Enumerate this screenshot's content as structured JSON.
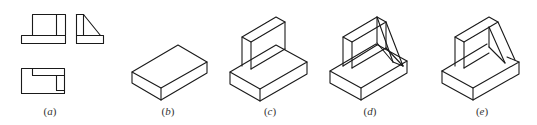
{
  "figure": {
    "type": "engineering-drawing",
    "line_color": "#1a1a1a",
    "background": "#ffffff",
    "panels": [
      {
        "id": "a",
        "label_open": "(",
        "label_letter": "a",
        "label_close": ")",
        "content": "orthographic three views: front, side, top"
      },
      {
        "id": "b",
        "label_open": "(",
        "label_letter": "b",
        "label_close": ")",
        "content": "isometric base plate"
      },
      {
        "id": "c",
        "label_open": "(",
        "label_letter": "c",
        "label_close": ")",
        "content": "base plate with vertical wall"
      },
      {
        "id": "d",
        "label_open": "(",
        "label_letter": "d",
        "label_close": ")",
        "content": "base, wall and triangular rib construction lines"
      },
      {
        "id": "e",
        "label_open": "(",
        "label_letter": "e",
        "label_close": ")",
        "content": "finished isometric bracket"
      }
    ]
  }
}
